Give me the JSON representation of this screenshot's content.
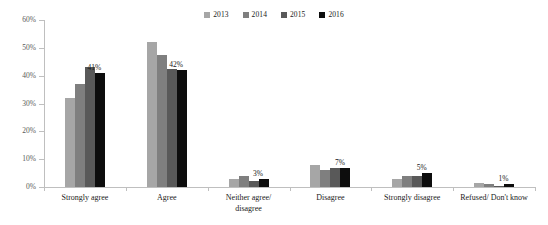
{
  "chart_data": {
    "type": "bar",
    "title": "",
    "subtitle": "",
    "xlabel": "",
    "ylabel": "",
    "ylim": [
      0,
      60
    ],
    "ytick_labels": [
      "0%",
      "10%",
      "20%",
      "30%",
      "40%",
      "50%",
      "60%"
    ],
    "ytick_values": [
      0,
      10,
      20,
      30,
      40,
      50,
      60
    ],
    "grid": false,
    "legend_position": "top-center",
    "categories": [
      "Strongly agree",
      "Agree",
      "Neither agree/ disagree",
      "Disagree",
      "Strongly disagree",
      "Refused/ Don't know"
    ],
    "category_lines": [
      [
        "Strongly agree"
      ],
      [
        "Agree"
      ],
      [
        "Neither agree/",
        "disagree"
      ],
      [
        "Disagree"
      ],
      [
        "Strongly disagree"
      ],
      [
        "Refused/ Don't know"
      ]
    ],
    "series": [
      {
        "name": "2013",
        "color": "#a6a6a6",
        "values": [
          32,
          52,
          3,
          8,
          3,
          1.5
        ]
      },
      {
        "name": "2014",
        "color": "#7f7f7f",
        "values": [
          37,
          47.5,
          4,
          6,
          4,
          1
        ]
      },
      {
        "name": "2015",
        "color": "#595959",
        "values": [
          43,
          42.5,
          2,
          7,
          4,
          0.5
        ]
      },
      {
        "name": "2016",
        "color": "#0d0d0d",
        "values": [
          41,
          42,
          3,
          7,
          5,
          1
        ]
      }
    ],
    "data_labels": {
      "series": "2016",
      "values": [
        "41%",
        "42%",
        "3%",
        "7%",
        "5%",
        "1%"
      ]
    },
    "colors": {
      "axis": "#bfbfbf",
      "tick_text": "#595959",
      "label_text": "#1a1a1a",
      "background": "#ffffff"
    }
  }
}
